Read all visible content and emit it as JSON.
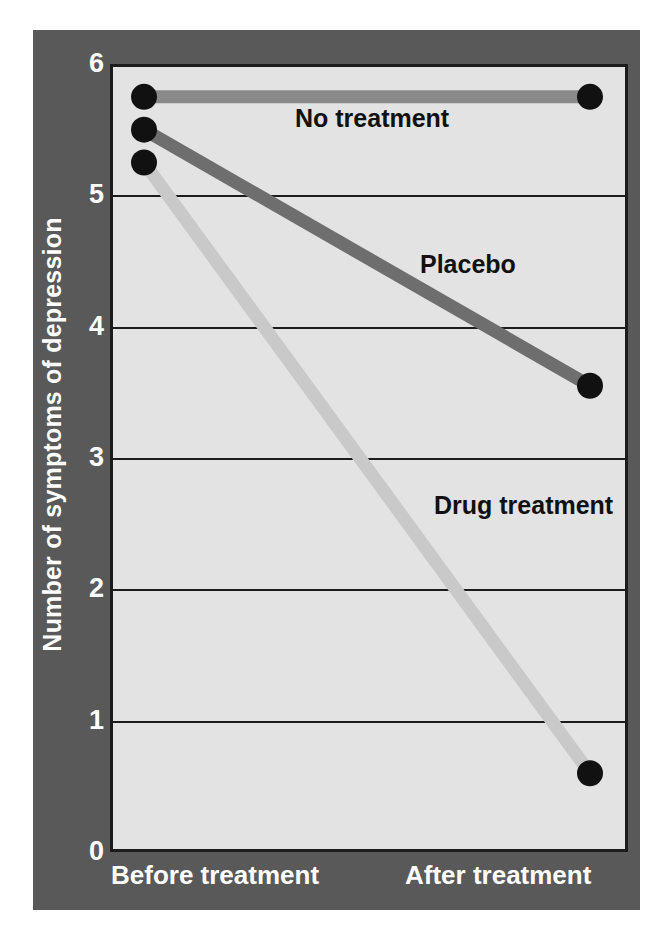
{
  "chart_data": {
    "type": "line",
    "title": "",
    "subtitle": "",
    "xlabel": "",
    "ylabel": "Number of symptoms of depression",
    "categories": [
      "Before treatment",
      "After treatment"
    ],
    "x": [
      0,
      1
    ],
    "ylim": [
      0,
      6
    ],
    "yticks": [
      0,
      1,
      2,
      3,
      4,
      5,
      6
    ],
    "ytick_labels": [
      "0",
      "1",
      "2",
      "3",
      "4",
      "5",
      "6"
    ],
    "grid": true,
    "grid_axis": "y",
    "legend": "inline-annotations",
    "legend_position": "inline",
    "markers": "filled-circle",
    "series": [
      {
        "name": "No treatment",
        "values": [
          5.75,
          5.75
        ],
        "color": "#8a8a8a",
        "label": "No treatment"
      },
      {
        "name": "Placebo",
        "values": [
          5.5,
          3.55
        ],
        "color": "#6e6e6e",
        "label": "Placebo"
      },
      {
        "name": "Drug treatment",
        "values": [
          5.25,
          0.6
        ],
        "color": "#c9c9c9",
        "label": "Drug treatment"
      }
    ],
    "annotations": [
      {
        "text": "No treatment",
        "series": "No treatment"
      },
      {
        "text": "Placebo",
        "series": "Placebo"
      },
      {
        "text": "Drug treatment",
        "series": "Drug treatment"
      }
    ],
    "colors": {
      "panel_background": "#595959",
      "plot_background": "#e3e3e3",
      "axis": "#1c1c1c",
      "tick_label": "#ffffff",
      "annotation_text": "#111111",
      "marker": "#111111"
    }
  },
  "axes": {
    "y": {
      "ticks": [
        {
          "label": "6"
        },
        {
          "label": "5"
        },
        {
          "label": "4"
        },
        {
          "label": "3"
        },
        {
          "label": "2"
        },
        {
          "label": "1"
        },
        {
          "label": "0"
        }
      ],
      "title": "Number of symptoms of depression"
    },
    "x": {
      "ticks": [
        {
          "label": "Before treatment"
        },
        {
          "label": "After treatment"
        }
      ]
    }
  },
  "labels": {
    "no_treatment": "No treatment",
    "placebo": "Placebo",
    "drug_treatment": "Drug treatment"
  }
}
